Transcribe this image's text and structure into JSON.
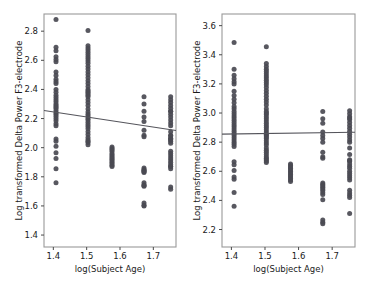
{
  "figure": {
    "panel_count": 2,
    "background": "#ffffff",
    "point_color": "#4a4a52",
    "line_color": "#55555c",
    "axis_color": "#9a9a9a"
  },
  "chart_data": [
    {
      "type": "scatter",
      "panel": "left",
      "title": "",
      "xlabel": "log(Subject Age)",
      "ylabel": "Log transformed Delta Power F3-electrode",
      "xticks": [
        1.4,
        1.5,
        1.6,
        1.7
      ],
      "xticklabels": [
        "1.4",
        "1.5",
        "1.6",
        "1.7"
      ],
      "yticks": [
        1.4,
        1.6,
        1.8,
        2.0,
        2.2,
        2.4,
        2.6,
        2.8
      ],
      "yticklabels": [
        "1.4",
        "1.6",
        "1.8",
        "2.0",
        "2.2",
        "2.4",
        "2.6",
        "2.8"
      ],
      "xlim": [
        1.372,
        1.768
      ],
      "ylim": [
        1.318,
        2.918
      ],
      "grid": false,
      "legend": null,
      "trendline": {
        "x": [
          1.372,
          1.768
        ],
        "y": [
          2.255,
          2.118
        ]
      },
      "x": [
        1.408,
        1.408,
        1.408,
        1.408,
        1.408,
        1.408,
        1.408,
        1.408,
        1.408,
        1.408,
        1.408,
        1.408,
        1.408,
        1.408,
        1.408,
        1.408,
        1.408,
        1.408,
        1.408,
        1.408,
        1.408,
        1.408,
        1.408,
        1.408,
        1.408,
        1.408,
        1.408,
        1.408,
        1.408,
        1.408,
        1.408,
        1.408,
        1.408,
        1.408,
        1.408,
        1.408,
        1.504,
        1.504,
        1.504,
        1.504,
        1.504,
        1.504,
        1.504,
        1.504,
        1.504,
        1.504,
        1.504,
        1.504,
        1.504,
        1.504,
        1.504,
        1.504,
        1.504,
        1.504,
        1.504,
        1.504,
        1.504,
        1.504,
        1.504,
        1.504,
        1.504,
        1.504,
        1.504,
        1.504,
        1.504,
        1.504,
        1.504,
        1.504,
        1.504,
        1.504,
        1.504,
        1.504,
        1.504,
        1.504,
        1.504,
        1.504,
        1.504,
        1.504,
        1.504,
        1.504,
        1.576,
        1.576,
        1.576,
        1.576,
        1.576,
        1.576,
        1.576,
        1.576,
        1.576,
        1.576,
        1.576,
        1.576,
        1.576,
        1.576,
        1.672,
        1.672,
        1.672,
        1.672,
        1.672,
        1.672,
        1.672,
        1.672,
        1.672,
        1.672,
        1.672,
        1.672,
        1.672,
        1.672,
        1.672,
        1.672,
        1.672,
        1.672,
        1.672,
        1.672,
        1.672,
        1.752,
        1.752,
        1.752,
        1.752,
        1.752,
        1.752,
        1.752,
        1.752,
        1.752,
        1.752,
        1.752,
        1.752,
        1.752,
        1.752,
        1.752,
        1.752,
        1.752,
        1.752,
        1.752,
        1.752,
        1.752,
        1.752,
        1.752,
        1.752,
        1.752,
        1.752,
        1.752,
        1.752,
        1.752,
        1.752,
        1.752,
        1.752
      ],
      "y": [
        2.88,
        2.69,
        2.665,
        2.625,
        2.605,
        2.59,
        2.52,
        2.495,
        2.47,
        2.455,
        2.44,
        2.4,
        2.38,
        2.36,
        2.345,
        2.33,
        2.315,
        2.3,
        2.29,
        2.28,
        2.27,
        2.255,
        2.24,
        2.23,
        2.215,
        2.2,
        2.185,
        2.165,
        2.15,
        2.06,
        2.045,
        2.01,
        1.965,
        1.925,
        1.855,
        1.76,
        2.805,
        2.7,
        2.685,
        2.67,
        2.655,
        2.64,
        2.625,
        2.61,
        2.595,
        2.58,
        2.56,
        2.54,
        2.52,
        2.5,
        2.48,
        2.46,
        2.44,
        2.42,
        2.4,
        2.39,
        2.38,
        2.37,
        2.36,
        2.35,
        2.33,
        2.31,
        2.29,
        2.265,
        2.245,
        2.23,
        2.215,
        2.2,
        2.19,
        2.175,
        2.16,
        2.145,
        2.13,
        2.11,
        2.09,
        2.07,
        2.055,
        2.045,
        2.035,
        2.02,
        2.005,
        1.995,
        1.985,
        1.975,
        1.96,
        1.95,
        1.94,
        1.93,
        1.92,
        1.91,
        1.9,
        1.89,
        1.88,
        1.87,
        1.86,
        1.85,
        1.845,
        1.84,
        1.835,
        1.83,
        1.76,
        1.745,
        1.74,
        1.735,
        1.62,
        1.605,
        1.6,
        2.35,
        2.3,
        2.25,
        2.21,
        2.18,
        2.12,
        2.085,
        2.075,
        2.065,
        2.055,
        2.045,
        2.03,
        1.87,
        2.35,
        2.33,
        2.31,
        2.29,
        2.27,
        2.25,
        2.23,
        2.21,
        2.19,
        2.17,
        2.15,
        2.11,
        2.08,
        2.06,
        2.25,
        2.085,
        1.975,
        1.96,
        1.945,
        1.93,
        1.915,
        1.9,
        1.885,
        1.87,
        1.855,
        1.73,
        1.715,
        1.7,
        1.685,
        1.6,
        1.535,
        1.45,
        1.435,
        1.41,
        1.385,
        2.82,
        2.81,
        2.79,
        2.7,
        2.68,
        2.66,
        2.64,
        2.62,
        2.6,
        2.58,
        2.56,
        2.54,
        2.52,
        2.5,
        2.48,
        2.46,
        2.44,
        2.42,
        2.4,
        2.38,
        2.35,
        2.25,
        2.23,
        2.21,
        2.19,
        2.17,
        2.13,
        2.06,
        2.04,
        1.77,
        1.75,
        1.73
      ]
    },
    {
      "type": "scatter",
      "panel": "right",
      "title": "",
      "xlabel": "log(Subject Age)",
      "ylabel": "Log transformed Delta Power F3-electrode",
      "xticks": [
        1.4,
        1.5,
        1.6,
        1.7
      ],
      "xticklabels": [
        "1.4",
        "1.5",
        "1.6",
        "1.7"
      ],
      "yticks": [
        2.2,
        2.4,
        2.6,
        2.8,
        3.0,
        3.2,
        3.4,
        3.6
      ],
      "yticklabels": [
        "2.2",
        "2.4",
        "2.6",
        "2.8",
        "3.0",
        "3.2",
        "3.4",
        "3.6"
      ],
      "xlim": [
        1.372,
        1.768
      ],
      "ylim": [
        2.08,
        3.68
      ],
      "grid": false,
      "legend": null,
      "trendline": {
        "x": [
          1.372,
          1.768
        ],
        "y": [
          2.855,
          2.868
        ]
      },
      "x": [
        1.408,
        1.408,
        1.408,
        1.408,
        1.408,
        1.408,
        1.408,
        1.408,
        1.408,
        1.408,
        1.408,
        1.408,
        1.408,
        1.408,
        1.408,
        1.408,
        1.408,
        1.408,
        1.408,
        1.408,
        1.408,
        1.408,
        1.408,
        1.408,
        1.408,
        1.408,
        1.408,
        1.408,
        1.408,
        1.408,
        1.408,
        1.408,
        1.408,
        1.408,
        1.408,
        1.408,
        1.504,
        1.504,
        1.504,
        1.504,
        1.504,
        1.504,
        1.504,
        1.504,
        1.504,
        1.504,
        1.504,
        1.504,
        1.504,
        1.504,
        1.504,
        1.504,
        1.504,
        1.504,
        1.504,
        1.504,
        1.504,
        1.504,
        1.504,
        1.504,
        1.504,
        1.504,
        1.504,
        1.504,
        1.504,
        1.504,
        1.504,
        1.504,
        1.504,
        1.504,
        1.504,
        1.504,
        1.504,
        1.504,
        1.504,
        1.504,
        1.504,
        1.504,
        1.504,
        1.504,
        1.504,
        1.504,
        1.576,
        1.576,
        1.576,
        1.576,
        1.576,
        1.576,
        1.576,
        1.576,
        1.576,
        1.576,
        1.576,
        1.576,
        1.576,
        1.672,
        1.672,
        1.672,
        1.672,
        1.672,
        1.672,
        1.672,
        1.672,
        1.672,
        1.672,
        1.672,
        1.672,
        1.672,
        1.672,
        1.672,
        1.672,
        1.672,
        1.672,
        1.672,
        1.672,
        1.672,
        1.672,
        1.752,
        1.752,
        1.752,
        1.752,
        1.752,
        1.752,
        1.752,
        1.752,
        1.752,
        1.752,
        1.752,
        1.752,
        1.752,
        1.752,
        1.752,
        1.752,
        1.752,
        1.752,
        1.752,
        1.752,
        1.752,
        1.752,
        1.752,
        1.752,
        1.752,
        1.752,
        1.752,
        1.752,
        1.752,
        1.752,
        1.752
      ],
      "y": [
        3.485,
        3.3,
        3.26,
        3.235,
        3.215,
        3.2,
        3.15,
        3.12,
        3.095,
        3.07,
        3.045,
        3.03,
        3.01,
        2.995,
        2.98,
        2.965,
        2.95,
        2.935,
        2.92,
        2.905,
        2.89,
        2.875,
        2.86,
        2.845,
        2.83,
        2.815,
        2.8,
        2.785,
        2.77,
        2.665,
        2.645,
        2.605,
        2.56,
        2.545,
        2.455,
        2.36,
        3.455,
        3.34,
        3.32,
        3.3,
        3.285,
        3.27,
        3.255,
        3.24,
        3.225,
        3.21,
        3.195,
        3.175,
        3.155,
        3.135,
        3.115,
        3.095,
        3.075,
        3.055,
        3.03,
        3.01,
        3.0,
        2.99,
        2.975,
        2.96,
        2.945,
        2.93,
        2.915,
        2.9,
        2.885,
        2.87,
        2.855,
        2.845,
        2.835,
        2.825,
        2.81,
        2.795,
        2.78,
        2.76,
        2.745,
        2.73,
        2.715,
        2.7,
        2.69,
        2.68,
        2.67,
        2.66,
        2.65,
        2.64,
        2.63,
        2.62,
        2.61,
        2.6,
        2.59,
        2.58,
        2.57,
        2.56,
        2.55,
        2.54,
        2.53,
        2.52,
        2.51,
        2.5,
        2.49,
        2.48,
        2.47,
        2.455,
        2.44,
        2.405,
        2.265,
        2.25,
        2.24,
        3.01,
        2.96,
        2.93,
        2.87,
        2.845,
        2.825,
        2.8,
        2.73,
        2.7,
        2.69,
        2.68,
        2.67,
        3.015,
        2.995,
        2.975,
        2.955,
        2.935,
        2.915,
        2.895,
        2.875,
        2.855,
        2.835,
        2.815,
        2.76,
        2.715,
        2.965,
        2.8,
        2.67,
        2.65,
        2.635,
        2.62,
        2.6,
        2.585,
        2.57,
        2.555,
        2.54,
        2.47,
        2.45,
        2.435,
        2.42,
        2.31,
        2.25,
        2.18,
        2.165,
        2.15,
        2.135,
        2.1,
        3.57,
        3.555,
        3.545,
        3.45,
        3.43,
        3.41,
        3.39,
        3.37,
        3.35,
        3.33,
        3.31,
        3.29,
        3.27,
        3.25,
        3.225,
        3.2,
        3.175,
        3.145,
        3.12,
        3.105,
        3.0,
        2.975,
        2.95,
        2.925,
        2.9,
        2.885,
        2.865,
        2.85,
        2.47,
        2.45,
        2.43
      ]
    }
  ]
}
